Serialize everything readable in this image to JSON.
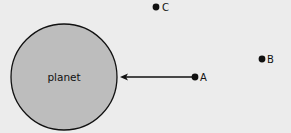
{
  "diagram": {
    "background": "#ececec",
    "planet": {
      "label": "planet",
      "fill": "#bdbdbd",
      "stroke": "#111111"
    },
    "points": [
      {
        "id": "A",
        "label": "A"
      },
      {
        "id": "B",
        "label": "B"
      },
      {
        "id": "C",
        "label": "C"
      }
    ],
    "arrow": {
      "from": "A",
      "to": "planet",
      "description": "force arrow pointing from A toward planet"
    }
  }
}
